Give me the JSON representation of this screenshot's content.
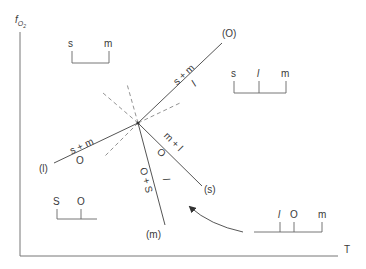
{
  "axes": {
    "y_label": "f",
    "y_label_sub": "O",
    "y_label_subsub": "2",
    "x_label": "T"
  },
  "invariant_point": {
    "x": 138,
    "y": 123
  },
  "reactions": [
    {
      "id": "O",
      "label": "(O)",
      "upper": "s + m",
      "lower": "l"
    },
    {
      "id": "l",
      "label": "(l)",
      "upper": "s + m",
      "lower": "O"
    },
    {
      "id": "s",
      "label": "(s)",
      "upper": "m + l",
      "lower": "O"
    },
    {
      "id": "m",
      "label": "(m)",
      "upper": "l",
      "lower": "O + S"
    }
  ],
  "chemographies": [
    {
      "position": "top-left",
      "phases": [
        "s",
        "m"
      ]
    },
    {
      "position": "right",
      "phases": [
        "s",
        "l",
        "m"
      ]
    },
    {
      "position": "bottom-left",
      "phases": [
        "S",
        "O"
      ]
    },
    {
      "position": "bottom-right",
      "phases": [
        "l",
        "O",
        "m"
      ]
    }
  ],
  "colors": {
    "line": "#555555",
    "dash": "#777777",
    "text": "#3a3a3a"
  }
}
